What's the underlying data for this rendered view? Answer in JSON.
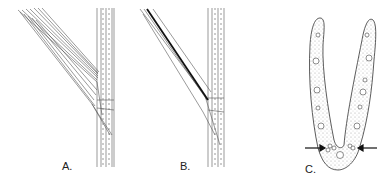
{
  "figure": {
    "panels": [
      {
        "id": "A",
        "label": "A.",
        "description": "Grass stem with leaf blade diverging from node"
      },
      {
        "id": "B",
        "label": "B.",
        "description": "Grass stem with leaf blade showing dark midrib"
      },
      {
        "id": "C",
        "label": "C.",
        "description": "Cross-section of V-shaped leaf with arrows pointing to bulliform cells at base"
      }
    ],
    "colors": {
      "ink": "#333333",
      "stipple": "#bbbbbb",
      "background": "#ffffff"
    }
  }
}
